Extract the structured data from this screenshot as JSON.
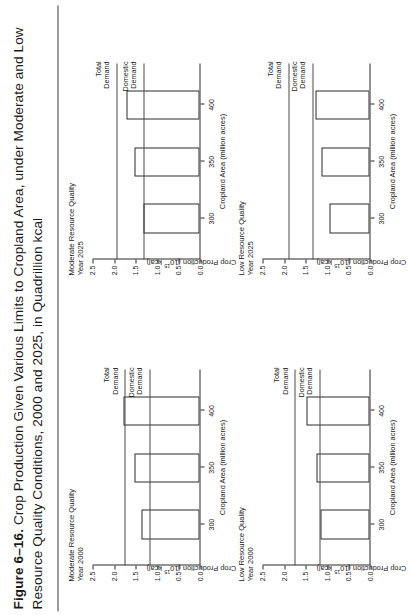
{
  "figure": {
    "number": "Figure 6–16.",
    "caption_line1": "Crop Production Given Various Limits to Cropland Area, under Moderate and Low",
    "caption_line2": "Resource Quality Conditions, 2000 and 2025, in Quadrillion kcal"
  },
  "axis": {
    "xlabel": "Cropland Area (million acres)",
    "ylabel_pre": "Crop Production (10",
    "ylabel_sup": "15",
    "ylabel_post": " kcal)",
    "yticks": [
      "0.0",
      "0.5",
      "1.0",
      "1.5",
      "2.0",
      "2.5"
    ],
    "xticks": [
      "300",
      "350",
      "400"
    ],
    "total_demand_label_l1": "Total",
    "total_demand_label_l2": "Demand",
    "domestic_demand_label_l1": "Domestic",
    "domestic_demand_label_l2": "Demand"
  },
  "chart_data": [
    {
      "id": "moderate-2000",
      "type": "bar",
      "title_line1": "Moderate Resource Quality",
      "title_line2": "Year 2000",
      "categories": [
        "300",
        "350",
        "400"
      ],
      "values": [
        1.35,
        1.5,
        1.75
      ],
      "xlabel": "Cropland Area (million acres)",
      "ylabel": "Crop Production (10^15 kcal)",
      "ylim": [
        0.0,
        2.5
      ],
      "reference_lines": [
        {
          "name": "Total Demand",
          "value": 1.75
        },
        {
          "name": "Domestic Demand",
          "value": 1.18
        }
      ]
    },
    {
      "id": "moderate-2025",
      "type": "bar",
      "title_line1": "Moderate Resource Quality",
      "title_line2": "Year 2025",
      "categories": [
        "300",
        "350",
        "400"
      ],
      "values": [
        1.3,
        1.5,
        1.7
      ],
      "xlabel": "Cropland Area (million acres)",
      "ylabel": "Crop Production (10^15 kcal)",
      "ylim": [
        0.0,
        2.5
      ],
      "reference_lines": [
        {
          "name": "Total Demand",
          "value": 1.95
        },
        {
          "name": "Domestic Demand",
          "value": 1.32
        }
      ]
    },
    {
      "id": "low-2000",
      "type": "bar",
      "title_line1": "Low Resource Quality",
      "title_line2": "Year 2000",
      "categories": [
        "300",
        "350",
        "400"
      ],
      "values": [
        1.13,
        1.22,
        1.46
      ],
      "xlabel": "Cropland Area (million acres)",
      "ylabel": "Crop Production (10^15 kcal)",
      "ylim": [
        0.0,
        2.5
      ],
      "reference_lines": [
        {
          "name": "Total Demand",
          "value": 1.75
        },
        {
          "name": "Domestic Demand",
          "value": 1.18
        }
      ]
    },
    {
      "id": "low-2025",
      "type": "bar",
      "title_line1": "Low Resource Quality",
      "title_line2": "Year 2025",
      "categories": [
        "300",
        "350",
        "400"
      ],
      "values": [
        0.92,
        1.12,
        1.25
      ],
      "xlabel": "Cropland Area (million acres)",
      "ylabel": "Crop Production (10^15 kcal)",
      "ylim": [
        0.0,
        2.5
      ],
      "reference_lines": [
        {
          "name": "Total Demand",
          "value": 1.9
        },
        {
          "name": "Domestic Demand",
          "value": 1.35
        }
      ]
    }
  ]
}
